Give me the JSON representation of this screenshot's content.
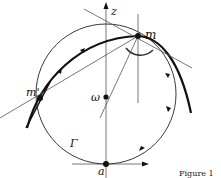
{
  "figure": {
    "caption": "Figure 1",
    "labels": {
      "z_axis": "z",
      "point_m": "m",
      "point_m_prime": "m'",
      "center_omega": "ω",
      "curve_gamma": "Γ",
      "point_a": "a"
    },
    "colors": {
      "stroke": "#111111",
      "thin_line": "#555555",
      "background": "#ffffff"
    }
  }
}
